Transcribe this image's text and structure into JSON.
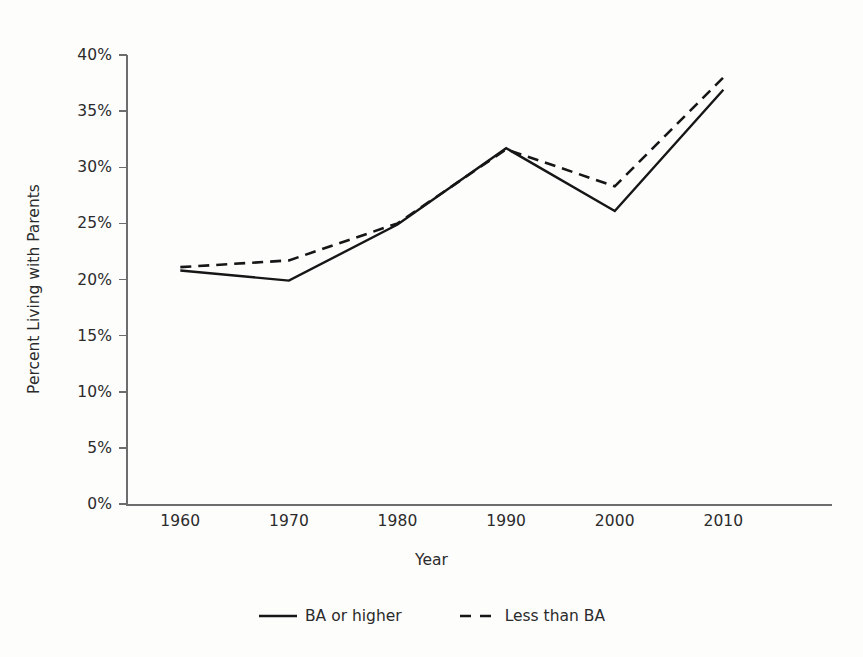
{
  "chart_data": {
    "type": "line",
    "title": "",
    "xlabel": "Year",
    "ylabel": "Percent Living with Parents",
    "x": [
      1960,
      1970,
      1980,
      1990,
      2000,
      2010
    ],
    "categories": [
      "1960",
      "1970",
      "1980",
      "1990",
      "2000",
      "2010"
    ],
    "xlim": [
      1955,
      2020
    ],
    "ylim": [
      0,
      40
    ],
    "ytick_labels": [
      "0%",
      "5%",
      "10%",
      "15%",
      "20%",
      "25%",
      "30%",
      "35%",
      "40%"
    ],
    "ytick_values": [
      0,
      5,
      10,
      15,
      20,
      25,
      30,
      35,
      40
    ],
    "grid": false,
    "legend_position": "bottom-center",
    "series": [
      {
        "name": "BA or higher",
        "style": "solid",
        "color": "#161616",
        "values": [
          20.8,
          19.9,
          24.9,
          31.7,
          26.1,
          36.9
        ]
      },
      {
        "name": "Less than BA",
        "style": "dashed",
        "color": "#161616",
        "values": [
          21.1,
          21.7,
          25.0,
          31.6,
          28.3,
          38.0
        ]
      }
    ]
  },
  "axes": {
    "y_title": "Percent Living with Parents",
    "x_title": "Year"
  },
  "legend": {
    "items": [
      {
        "label": "BA or higher",
        "style": "solid"
      },
      {
        "label": "Less than BA",
        "style": "dashed"
      }
    ]
  }
}
